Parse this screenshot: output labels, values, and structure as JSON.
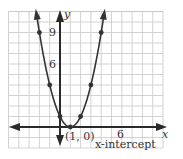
{
  "chart_data": {
    "type": "line",
    "title": "",
    "equation": "y = (x - 1)^2",
    "xlabel": "x",
    "ylabel": "y",
    "xlim": [
      -5,
      10
    ],
    "ylim": [
      -2,
      11
    ],
    "grid": true,
    "x_tick_labels": [
      {
        "value": 6,
        "label": "6"
      }
    ],
    "y_tick_labels": [
      {
        "value": 6,
        "label": "6"
      },
      {
        "value": 9,
        "label": "9"
      }
    ],
    "points": [
      {
        "x": -2,
        "y": 9
      },
      {
        "x": -1,
        "y": 4
      },
      {
        "x": 0,
        "y": 1
      },
      {
        "x": 1,
        "y": 0
      },
      {
        "x": 2,
        "y": 1
      },
      {
        "x": 3,
        "y": 4
      },
      {
        "x": 4,
        "y": 9
      }
    ],
    "annotations": [
      {
        "text": "(1, 0)",
        "x": 1,
        "y": 0
      },
      {
        "text": "x-intercept"
      }
    ]
  },
  "labels": {
    "x_axis": "x",
    "y_axis": "y",
    "tick_x6": "6",
    "tick_y6": "6",
    "tick_y9": "9",
    "vertex": "(1, 0)",
    "intercept": "x-intercept"
  },
  "colors": {
    "grid": "#c8c8c8",
    "axis": "#2a2a2a",
    "curve": "#333333",
    "background": "#ffffff"
  }
}
